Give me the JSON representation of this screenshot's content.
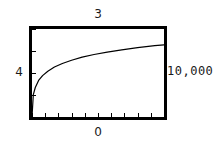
{
  "chart_data": {
    "type": "line",
    "title": "",
    "subtitle": "",
    "xlabel": "",
    "ylabel": "",
    "labels": {
      "top": "3",
      "left": "4",
      "right": "10,000",
      "bottom": "0"
    },
    "grid": false,
    "legend": false,
    "legend_position": "none",
    "frame": true,
    "frame_color": "#000000",
    "line_color": "#000000",
    "xlim": [
      0,
      10000
    ],
    "ylim": [
      0,
      4
    ],
    "x_ticks": [
      0,
      1000,
      2000,
      3000,
      4000,
      5000,
      6000,
      7000,
      8000,
      9000,
      10000
    ],
    "x_tick_labels": [
      "",
      "",
      "",
      "",
      "",
      "",
      "",
      "",
      "",
      "",
      ""
    ],
    "y_ticks": [
      1,
      2,
      3,
      4
    ],
    "y_tick_labels": [
      "",
      "",
      "",
      ""
    ],
    "series": [
      {
        "name": "curve",
        "x": [
          0,
          100,
          250,
          500,
          800,
          1200,
          1700,
          2300,
          3000,
          3800,
          4700,
          5700,
          6800,
          8000,
          9300,
          10000
        ],
        "y": [
          0.0,
          1.02,
          1.34,
          1.66,
          1.88,
          2.08,
          2.27,
          2.43,
          2.58,
          2.72,
          2.84,
          2.95,
          3.05,
          3.15,
          3.24,
          3.28
        ]
      }
    ],
    "annotations": []
  }
}
